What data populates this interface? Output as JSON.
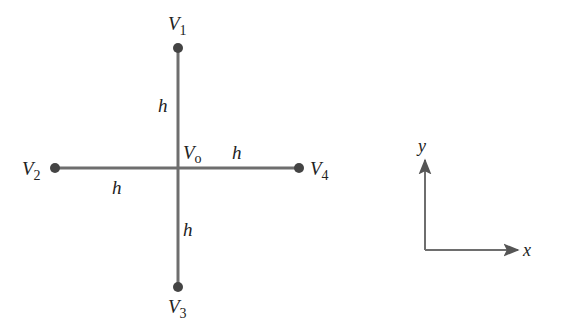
{
  "diagram": {
    "colors": {
      "line": "#6e6e6e",
      "node": "#444444",
      "text": "#222222"
    },
    "center": {
      "label": "V",
      "subscript": "o",
      "x": 178,
      "y": 168
    },
    "nodes": [
      {
        "id": "V1",
        "label": "V",
        "subscript": "1",
        "x": 178,
        "y": 48,
        "position": "top"
      },
      {
        "id": "V2",
        "label": "V",
        "subscript": "2",
        "x": 55,
        "y": 168,
        "position": "left"
      },
      {
        "id": "V3",
        "label": "V",
        "subscript": "3",
        "x": 178,
        "y": 287,
        "position": "bottom"
      },
      {
        "id": "V4",
        "label": "V",
        "subscript": "4",
        "x": 299,
        "y": 168,
        "position": "right"
      }
    ],
    "spacing_labels": [
      {
        "text": "h",
        "segment": "V1-Vo"
      },
      {
        "text": "h",
        "segment": "V2-Vo"
      },
      {
        "text": "h",
        "segment": "Vo-V4"
      },
      {
        "text": "h",
        "segment": "Vo-V3"
      }
    ],
    "axes": {
      "x_label": "x",
      "y_label": "y"
    }
  }
}
